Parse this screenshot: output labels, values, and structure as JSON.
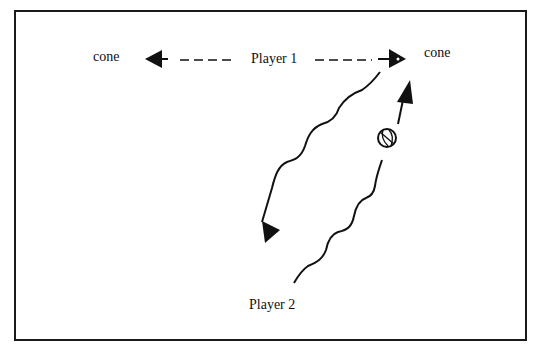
{
  "diagram": {
    "labels": {
      "cone_left": "cone",
      "cone_right": "cone",
      "player1": "Player 1",
      "player2": "Player 2"
    },
    "icons": {
      "ball": "basketball-icon",
      "arrow": "arrowhead-icon"
    },
    "colors": {
      "ink": "#111111",
      "background": "#ffffff",
      "frame": "#1a1a1a"
    },
    "paths": [
      {
        "name": "player1-pass-left",
        "style": "dashed",
        "from": "player1",
        "to": "cone_left"
      },
      {
        "name": "player1-pass-right",
        "style": "dashed",
        "from": "player1",
        "to": "cone_right"
      },
      {
        "name": "player2-cut-path",
        "style": "wavy",
        "from": "cone_right",
        "to": "player2-area"
      },
      {
        "name": "player2-dribble-path",
        "style": "wavy",
        "from": "player2",
        "to": "cone_right"
      },
      {
        "name": "player2-return-arrow",
        "style": "solid",
        "direction": "down-left"
      },
      {
        "name": "ball-to-cone-arrow",
        "style": "solid",
        "direction": "up-right"
      }
    ]
  }
}
